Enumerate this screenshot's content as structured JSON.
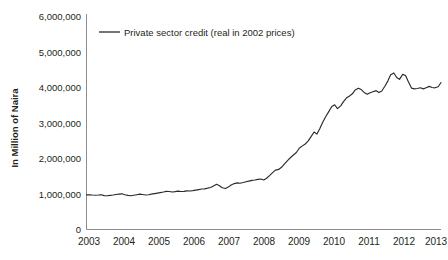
{
  "chart_data": {
    "type": "line",
    "title": "",
    "subtitle": "",
    "xlabel": "",
    "ylabel": "In Million of Naira",
    "ylim": [
      0,
      6000000
    ],
    "xlim": [
      2003,
      2013
    ],
    "grid": false,
    "legend_position": "top-left-inside",
    "y_ticks": [
      0,
      1000000,
      2000000,
      3000000,
      4000000,
      5000000,
      6000000
    ],
    "y_tick_labels": [
      "0",
      "1,000,000",
      "2,000,000",
      "3,000,000",
      "4,000,000",
      "5,000,000",
      "6,000,000"
    ],
    "x_ticks": [
      2003,
      2004,
      2005,
      2006,
      2007,
      2008,
      2009,
      2010,
      2011,
      2012,
      2013
    ],
    "x_tick_labels": [
      "2003",
      "2004",
      "2005",
      "2006",
      "2007",
      "2008",
      "2009",
      "2010",
      "2011",
      "2012",
      "2013"
    ],
    "series": [
      {
        "name": "Private sector credit (real in 2002 prices)",
        "color": "#2b2b2b",
        "x": [
          2003.0,
          2003.08,
          2003.17,
          2003.25,
          2003.33,
          2003.42,
          2003.5,
          2003.58,
          2003.67,
          2003.75,
          2003.83,
          2003.92,
          2004.0,
          2004.08,
          2004.17,
          2004.25,
          2004.33,
          2004.42,
          2004.5,
          2004.58,
          2004.67,
          2004.75,
          2004.83,
          2004.92,
          2005.0,
          2005.08,
          2005.17,
          2005.25,
          2005.33,
          2005.42,
          2005.5,
          2005.58,
          2005.67,
          2005.75,
          2005.83,
          2005.92,
          2006.0,
          2006.08,
          2006.17,
          2006.25,
          2006.33,
          2006.42,
          2006.5,
          2006.58,
          2006.67,
          2006.75,
          2006.83,
          2006.92,
          2007.0,
          2007.08,
          2007.17,
          2007.25,
          2007.33,
          2007.42,
          2007.5,
          2007.58,
          2007.67,
          2007.75,
          2007.83,
          2007.92,
          2008.0,
          2008.08,
          2008.17,
          2008.25,
          2008.33,
          2008.42,
          2008.5,
          2008.58,
          2008.67,
          2008.75,
          2008.83,
          2008.92,
          2009.0,
          2009.08,
          2009.17,
          2009.25,
          2009.33,
          2009.42,
          2009.5,
          2009.58,
          2009.67,
          2009.75,
          2009.83,
          2009.92,
          2010.0,
          2010.08,
          2010.17,
          2010.25,
          2010.33,
          2010.42,
          2010.5,
          2010.58,
          2010.67,
          2010.75,
          2010.83,
          2010.92,
          2011.0,
          2011.08,
          2011.17,
          2011.25,
          2011.33,
          2011.42,
          2011.5,
          2011.58,
          2011.67,
          2011.75,
          2011.83,
          2011.92,
          2012.0,
          2012.08,
          2012.17,
          2012.25,
          2012.33,
          2012.42,
          2012.5,
          2012.58,
          2012.67,
          2012.75,
          2012.83,
          2012.92,
          2013.0
        ],
        "values": [
          980000,
          985000,
          975000,
          970000,
          975000,
          985000,
          960000,
          955000,
          965000,
          975000,
          990000,
          1000000,
          1010000,
          985000,
          965000,
          955000,
          970000,
          985000,
          1000000,
          990000,
          975000,
          985000,
          1000000,
          1015000,
          1030000,
          1045000,
          1060000,
          1080000,
          1075000,
          1060000,
          1070000,
          1085000,
          1075000,
          1080000,
          1095000,
          1090000,
          1100000,
          1115000,
          1130000,
          1145000,
          1150000,
          1170000,
          1190000,
          1230000,
          1280000,
          1240000,
          1180000,
          1160000,
          1200000,
          1260000,
          1300000,
          1320000,
          1310000,
          1330000,
          1350000,
          1370000,
          1390000,
          1400000,
          1420000,
          1430000,
          1400000,
          1450000,
          1530000,
          1610000,
          1680000,
          1700000,
          1760000,
          1850000,
          1950000,
          2030000,
          2100000,
          2180000,
          2300000,
          2360000,
          2420000,
          2500000,
          2620000,
          2760000,
          2700000,
          2850000,
          3050000,
          3200000,
          3330000,
          3480000,
          3530000,
          3420000,
          3500000,
          3620000,
          3720000,
          3780000,
          3840000,
          3950000,
          4000000,
          3960000,
          3880000,
          3830000,
          3870000,
          3900000,
          3930000,
          3880000,
          3920000,
          4060000,
          4200000,
          4380000,
          4430000,
          4300000,
          4250000,
          4390000,
          4360000,
          4180000,
          4000000,
          3980000,
          3990000,
          4010000,
          3980000,
          4010000,
          4050000,
          4020000,
          4010000,
          4040000,
          4160000
        ]
      }
    ],
    "series_extended_note": "",
    "annotations": []
  },
  "legend": {
    "entries": [
      {
        "label": "Private sector credit (real in 2002 prices)",
        "color": "#2b2b2b"
      }
    ]
  },
  "axes": {
    "y_axis_title": "In Million of Naira",
    "y_tick_labels": [
      "6,000,000",
      "5,000,000",
      "4,000,000",
      "3,000,000",
      "2,000,000",
      "1,000,000",
      "0"
    ],
    "x_tick_labels": [
      "2003",
      "2004",
      "2005",
      "2006",
      "2007",
      "2008",
      "2009",
      "2010",
      "2011",
      "2012",
      "2013"
    ]
  },
  "colors": {
    "line": "#2b2b2b",
    "axis": "#8c8c8c",
    "text": "#231f20",
    "background": "#ffffff"
  }
}
